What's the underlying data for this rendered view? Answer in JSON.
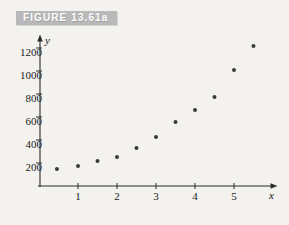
{
  "figure": {
    "banner_label": "FIGURE 13.61a",
    "banner_color": "#b9b9b9",
    "background_color": "#f3f2ef"
  },
  "chart_data": {
    "type": "scatter",
    "title": "",
    "xlabel": "x",
    "ylabel": "y",
    "xlim": [
      0,
      6
    ],
    "ylim": [
      0,
      1300
    ],
    "xticks": [
      1,
      2,
      3,
      4,
      5
    ],
    "yticks": [
      200,
      400,
      600,
      800,
      1000,
      1200
    ],
    "xtick_labels": [
      "1",
      "2",
      "3",
      "4",
      "5"
    ],
    "ytick_labels": [
      "200",
      "400",
      "600",
      "800",
      "1000",
      "1200"
    ],
    "grid": false,
    "legend": null,
    "marker": {
      "shape": "circle",
      "color": "#3a3a3a",
      "size_px": 4
    },
    "x": [
      0.46,
      1.0,
      1.5,
      2.0,
      2.5,
      3.0,
      3.5,
      4.0,
      4.5,
      5.0,
      5.5
    ],
    "y": [
      148,
      174,
      217,
      252,
      330,
      426,
      557,
      661,
      774,
      1009,
      1217
    ],
    "points": [
      {
        "x": 0.46,
        "y": 148
      },
      {
        "x": 1.0,
        "y": 174
      },
      {
        "x": 1.5,
        "y": 217
      },
      {
        "x": 2.0,
        "y": 252
      },
      {
        "x": 2.5,
        "y": 330
      },
      {
        "x": 3.0,
        "y": 426
      },
      {
        "x": 3.5,
        "y": 557
      },
      {
        "x": 4.0,
        "y": 661
      },
      {
        "x": 4.5,
        "y": 774
      },
      {
        "x": 5.0,
        "y": 1009
      },
      {
        "x": 5.5,
        "y": 1217
      }
    ],
    "axis_geometry": {
      "origin_px": [
        39,
        186
      ],
      "x_unit_px": 39,
      "y_unit_px": 0.115,
      "x_axis_end_px": 278,
      "y_axis_top_px": 36
    }
  }
}
